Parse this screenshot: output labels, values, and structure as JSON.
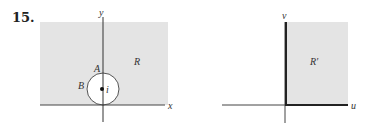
{
  "problem_number": "15.",
  "colors": {
    "region_fill": "#e4e4e4",
    "axis": "#333333",
    "circle_interior": "#ffffff",
    "circle_stroke": "#555555"
  },
  "left_figure": {
    "region_label": "R",
    "x_axis_label": "x",
    "y_axis_label": "y",
    "point_A_label": "A",
    "point_B_label": "B",
    "center_label": "i"
  },
  "right_figure": {
    "region_label": "R′",
    "u_axis_label": "u",
    "v_axis_label": "v"
  }
}
